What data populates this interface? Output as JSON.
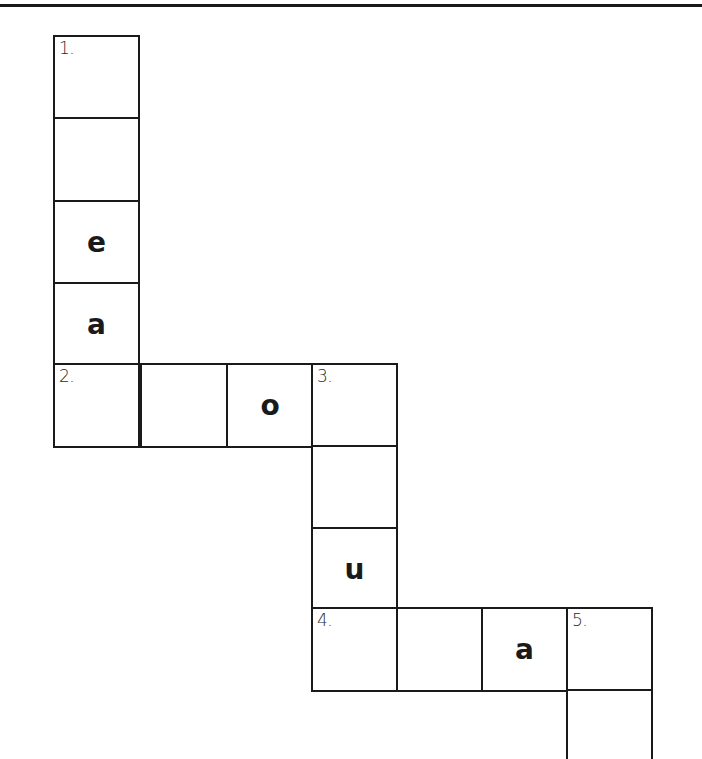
{
  "puzzle": {
    "type": "crossword",
    "cell_size_px": 86,
    "clue_numbers": [
      "1.",
      "2.",
      "3.",
      "4.",
      "5."
    ],
    "cells": [
      {
        "id": "r0c0",
        "x": 53,
        "y": 35,
        "number": "1.",
        "letter": ""
      },
      {
        "id": "r1c0",
        "x": 53,
        "y": 117,
        "number": "",
        "letter": ""
      },
      {
        "id": "r2c0",
        "x": 53,
        "y": 200,
        "number": "",
        "letter": "e"
      },
      {
        "id": "r3c0",
        "x": 53,
        "y": 282,
        "number": "",
        "letter": "a"
      },
      {
        "id": "r4c0",
        "x": 53,
        "y": 363,
        "number": "2.",
        "letter": ""
      },
      {
        "id": "r4c1",
        "x": 140,
        "y": 363,
        "number": "",
        "letter": ""
      },
      {
        "id": "r4c2",
        "x": 226,
        "y": 363,
        "number": "",
        "letter": "o"
      },
      {
        "id": "r4c3",
        "x": 311,
        "y": 363,
        "number": "3.",
        "letter": ""
      },
      {
        "id": "r5c3",
        "x": 311,
        "y": 445,
        "number": "",
        "letter": ""
      },
      {
        "id": "r6c3",
        "x": 311,
        "y": 527,
        "number": "",
        "letter": "u"
      },
      {
        "id": "r7c3",
        "x": 311,
        "y": 607,
        "number": "4.",
        "letter": ""
      },
      {
        "id": "r7c4",
        "x": 396,
        "y": 607,
        "number": "",
        "letter": ""
      },
      {
        "id": "r7c5",
        "x": 481,
        "y": 607,
        "number": "",
        "letter": "a"
      },
      {
        "id": "r7c6",
        "x": 566,
        "y": 607,
        "number": "5.",
        "letter": ""
      },
      {
        "id": "r8c6",
        "x": 566,
        "y": 689,
        "number": "",
        "letter": ""
      }
    ]
  }
}
